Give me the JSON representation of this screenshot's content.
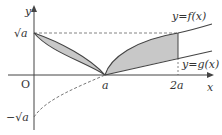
{
  "diagram": {
    "type": "function-graph",
    "axes": {
      "x_label": "x",
      "y_label": "y",
      "origin_label": "O"
    },
    "x_ticks": [
      "a",
      "2a"
    ],
    "y_ticks": [
      "√a",
      "−√a"
    ],
    "curves": [
      {
        "name": "f",
        "label": "y=f(x)"
      },
      {
        "name": "g",
        "label": "y=g(x)"
      }
    ],
    "shaded_regions": 2,
    "colors": {
      "curve": "#444444",
      "shade": "#c8c8c8",
      "axis": "#444444",
      "dash": "#666666"
    }
  }
}
